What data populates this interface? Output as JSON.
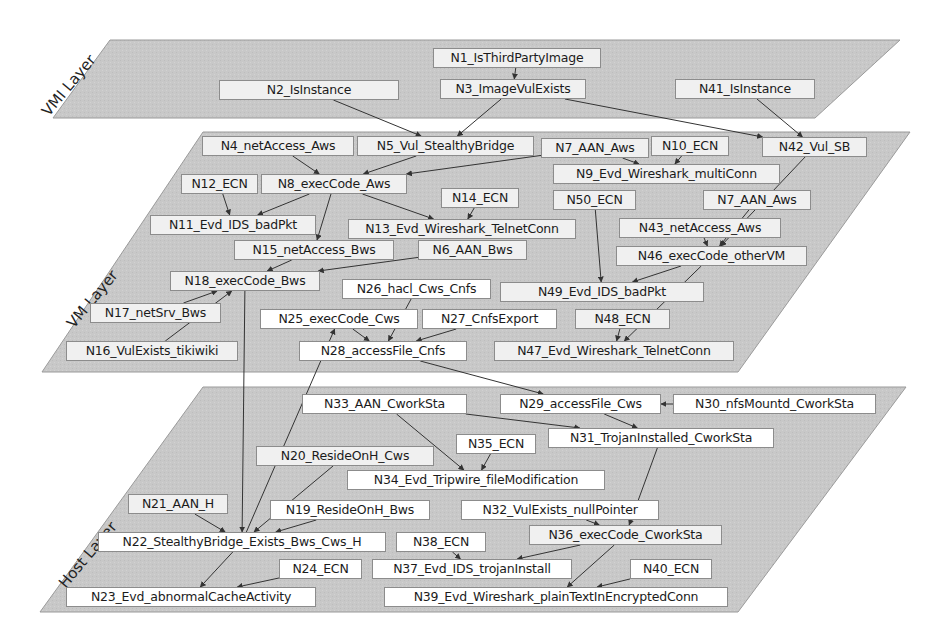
{
  "layers": [
    {
      "id": "vmi",
      "label": "VMI Layer",
      "color": "#c9c9c9"
    },
    {
      "id": "vm",
      "label": "VM Layer",
      "color": "#c6c6c6"
    },
    {
      "id": "host",
      "label": "Host Layer",
      "color": "#c8c8c8"
    }
  ],
  "nodes": {
    "N1": "N1_IsThirdPartyImage",
    "N2": "N2_IsInstance",
    "N3": "N3_ImageVulExists",
    "N41": "N41_IsInstance",
    "N4": "N4_netAccess_Aws",
    "N5": "N5_Vul_StealthyBridge",
    "N7a": "N7_AAN_Aws",
    "N10": "N10_ECN",
    "N42": "N42_Vul_SB",
    "N9": "N9_Evd_Wireshark_multiConn",
    "N12": "N12_ECN",
    "N8": "N8_execCode_Aws",
    "N14": "N14_ECN",
    "N50": "N50_ECN",
    "N7b": "N7_AAN_Aws",
    "N11": "N11_Evd_IDS_badPkt",
    "N13": "N13_Evd_Wireshark_TelnetConn",
    "N43": "N43_netAccess_Aws",
    "N15": "N15_netAccess_Bws",
    "N6": "N6_AAN_Bws",
    "N46": "N46_execCode_otherVM",
    "N18": "N18_execCode_Bws",
    "N26": "N26_hacl_Cws_Cnfs",
    "N49": "N49_Evd_IDS_badPkt",
    "N17": "N17_netSrv_Bws",
    "N25": "N25_execCode_Cws",
    "N27": "N27_CnfsExport",
    "N48": "N48_ECN",
    "N16": "N16_VulExists_tikiwiki",
    "N28": "N28_accessFile_Cnfs",
    "N47": "N47_Evd_Wireshark_TelnetConn",
    "N33": "N33_AAN_CworkSta",
    "N29": "N29_accessFile_Cws",
    "N30": "N30_nfsMountd_CworkSta",
    "N35": "N35_ECN",
    "N31": "N31_TrojanInstalled_CworkSta",
    "N20": "N20_ResideOnH_Cws",
    "N34": "N34_Evd_Tripwire_fileModification",
    "N21": "N21_AAN_H",
    "N19": "N19_ResideOnH_Bws",
    "N32": "N32_VulExists_nullPointer",
    "N22": "N22_StealthyBridge_Exists_Bws_Cws_H",
    "N36": "N36_execCode_CworkSta",
    "N38": "N38_ECN",
    "N24": "N24_ECN",
    "N37": "N37_Evd_IDS_trojanInstall",
    "N40": "N40_ECN",
    "N23": "N23_Evd_abnormalCacheActivity",
    "N39": "N39_Evd_Wireshark_plainTextInEncryptedConn"
  },
  "edges": [
    [
      "N1",
      "N3"
    ],
    [
      "N2",
      "N5"
    ],
    [
      "N3",
      "N5"
    ],
    [
      "N3",
      "N42"
    ],
    [
      "N41",
      "N42"
    ],
    [
      "N4",
      "N8"
    ],
    [
      "N5",
      "N8"
    ],
    [
      "N7a",
      "N8"
    ],
    [
      "N7a",
      "N9"
    ],
    [
      "N10",
      "N9"
    ],
    [
      "N12",
      "N11"
    ],
    [
      "N8",
      "N11"
    ],
    [
      "N8",
      "N13"
    ],
    [
      "N8",
      "N15"
    ],
    [
      "N14",
      "N13"
    ],
    [
      "N15",
      "N18"
    ],
    [
      "N6",
      "N18"
    ],
    [
      "N17",
      "N18"
    ],
    [
      "N16",
      "N18"
    ],
    [
      "N42",
      "N46"
    ],
    [
      "N7b",
      "N46"
    ],
    [
      "N43",
      "N46"
    ],
    [
      "N50",
      "N49"
    ],
    [
      "N46",
      "N49"
    ],
    [
      "N46",
      "N47"
    ],
    [
      "N48",
      "N47"
    ],
    [
      "N26",
      "N28"
    ],
    [
      "N25",
      "N28"
    ],
    [
      "N27",
      "N28"
    ],
    [
      "N28",
      "N29"
    ],
    [
      "N30",
      "N29"
    ],
    [
      "N29",
      "N31"
    ],
    [
      "N33",
      "N31"
    ],
    [
      "N33",
      "N34"
    ],
    [
      "N35",
      "N34"
    ],
    [
      "N18",
      "N22"
    ],
    [
      "N22",
      "N25"
    ],
    [
      "N20",
      "N22"
    ],
    [
      "N21",
      "N22"
    ],
    [
      "N19",
      "N22"
    ],
    [
      "N22",
      "N23"
    ],
    [
      "N24",
      "N23"
    ],
    [
      "N31",
      "N36"
    ],
    [
      "N32",
      "N36"
    ],
    [
      "N36",
      "N37"
    ],
    [
      "N38",
      "N37"
    ],
    [
      "N36",
      "N39"
    ],
    [
      "N40",
      "N39"
    ]
  ]
}
